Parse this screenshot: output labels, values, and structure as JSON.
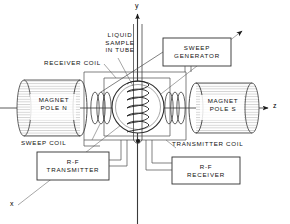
{
  "figure": {
    "background_color": "#ffffff",
    "line_color": "#2b2b2b",
    "text_color": "#111111"
  },
  "axes": {
    "y": {
      "label": "y"
    },
    "z": {
      "label": "z"
    },
    "x": {
      "label": "x"
    }
  },
  "labels": {
    "liquid_sample": "LIQUID\nSAMPLE\nIN TUBE",
    "receiver_coil": "RECEIVER COIL",
    "sweep_coil": "SWEEP COIL",
    "transmitter_coil": "TRANSMITTER COIL",
    "magnet_pole_n": "MAGNET\nPOLE N",
    "magnet_pole_s": "MAGNET\nPOLE S"
  },
  "boxes": {
    "sweep_generator": "SWEEP\nGENERATOR",
    "rf_transmitter": "R-F\nTRANSMITTER",
    "rf_receiver": "R-F\nRECEIVER"
  }
}
